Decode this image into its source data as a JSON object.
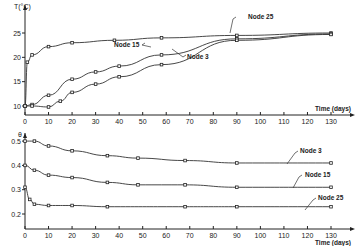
{
  "chart_data": [
    {
      "type": "line",
      "title": "",
      "xlabel": "Time (days)",
      "ylabel": "T(°C)",
      "xlim": [
        0,
        135
      ],
      "ylim": [
        8,
        27
      ],
      "x_ticks": [
        0,
        10,
        20,
        30,
        40,
        50,
        60,
        70,
        80,
        90,
        100,
        110,
        120,
        130
      ],
      "y_ticks": [
        10,
        15,
        20,
        25
      ],
      "grid": false,
      "legend": "inline labels",
      "series": [
        {
          "name": "Node 25",
          "x": [
            0,
            1,
            3,
            10,
            20,
            38,
            58,
            90,
            130
          ],
          "values": [
            10,
            19,
            20.5,
            22.2,
            23,
            23.5,
            24,
            24.5,
            25
          ]
        },
        {
          "name": "Node 15",
          "x": [
            0,
            3,
            10,
            20,
            30,
            40,
            58,
            90,
            130
          ],
          "values": [
            10,
            10.3,
            12.2,
            15.5,
            17,
            18.2,
            20.5,
            23.8,
            24.8
          ]
        },
        {
          "name": "Node 3",
          "x": [
            0,
            3,
            10,
            15,
            20,
            30,
            40,
            58,
            90,
            130
          ],
          "values": [
            10,
            10,
            9.8,
            11,
            12.8,
            14.5,
            16,
            18.5,
            23.5,
            24.7
          ]
        }
      ]
    },
    {
      "type": "line",
      "title": "",
      "xlabel": "Time (days)",
      "ylabel": "θ",
      "xlim": [
        0,
        135
      ],
      "ylim": [
        0.15,
        0.52
      ],
      "x_ticks": [
        0,
        10,
        20,
        30,
        40,
        50,
        60,
        70,
        80,
        90,
        100,
        110,
        120,
        130
      ],
      "y_ticks": [
        0.2,
        0.3,
        0.4,
        0.5
      ],
      "grid": false,
      "legend": "inline labels",
      "series": [
        {
          "name": "Node 3",
          "x": [
            0,
            4,
            10,
            20,
            35,
            48,
            68,
            90,
            130
          ],
          "values": [
            0.5,
            0.5,
            0.48,
            0.46,
            0.44,
            0.43,
            0.42,
            0.41,
            0.41
          ]
        },
        {
          "name": "Node 15",
          "x": [
            0,
            4,
            10,
            20,
            35,
            48,
            68,
            90,
            130
          ],
          "values": [
            0.4,
            0.38,
            0.36,
            0.35,
            0.33,
            0.32,
            0.32,
            0.31,
            0.31
          ]
        },
        {
          "name": "Node 25",
          "x": [
            0,
            2,
            4,
            10,
            20,
            35,
            68,
            90,
            130
          ],
          "values": [
            0.31,
            0.26,
            0.24,
            0.235,
            0.235,
            0.23,
            0.23,
            0.23,
            0.23
          ]
        }
      ]
    }
  ],
  "top": {
    "ylabel": "T(°C)",
    "xlabel": "Time (days)",
    "labels": [
      "Node 25",
      "Node 15",
      "Node 3"
    ]
  },
  "bottom": {
    "ylabel": "θ",
    "xlabel": "Time (days)",
    "labels": [
      "Node 3",
      "Node 15",
      "Node 25"
    ]
  }
}
